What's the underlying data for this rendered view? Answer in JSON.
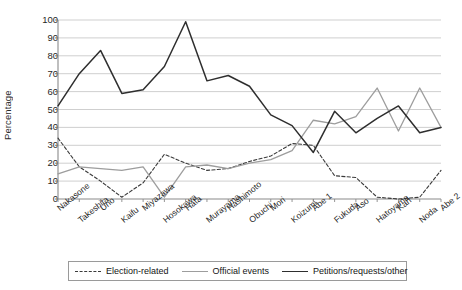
{
  "chart_data": {
    "type": "line",
    "title": "",
    "xlabel": "",
    "ylabel": "Percentage",
    "ylim": [
      0,
      100
    ],
    "ytick_values": [
      0,
      10,
      20,
      30,
      40,
      50,
      60,
      70,
      80,
      90,
      100
    ],
    "grid": "horizontal",
    "legend_position": "bottom",
    "categories": [
      "Nakasone",
      "Takeshita",
      "Uno",
      "Kaifu",
      "Miyazawa",
      "Hosokawa",
      "Hata",
      "Murayama",
      "Hashimoto",
      "Obuchi",
      "Mori",
      "Koizumi",
      "Abe 1",
      "Fukuda",
      "Aso",
      "Hatoyama",
      "Kan",
      "Noda",
      "Abe 2"
    ],
    "series": [
      {
        "name": "Election-related",
        "style": "dashed",
        "color": "#3a3a3a",
        "values": [
          34,
          18,
          10,
          1,
          9,
          25,
          20,
          16,
          17,
          21,
          24,
          31,
          30,
          13,
          12,
          1,
          0,
          1,
          16
        ]
      },
      {
        "name": "Official events",
        "style": "solid-light",
        "color": "#9d9d9d",
        "values": [
          14,
          18,
          17,
          16,
          18,
          1,
          18,
          19,
          17,
          20,
          22,
          27,
          44,
          42,
          46,
          62,
          38,
          62,
          40
        ]
      },
      {
        "name": "Petitions/requests/other",
        "style": "solid-dark",
        "color": "#2e2e2e",
        "values": [
          52,
          70,
          83,
          59,
          61,
          74,
          99,
          66,
          69,
          63,
          47,
          41,
          26,
          49,
          37,
          45,
          52,
          37,
          40
        ]
      }
    ]
  },
  "legend": {
    "items": [
      {
        "label": "Election-related"
      },
      {
        "label": "Official events"
      },
      {
        "label": "Petitions/requests/other"
      }
    ]
  }
}
